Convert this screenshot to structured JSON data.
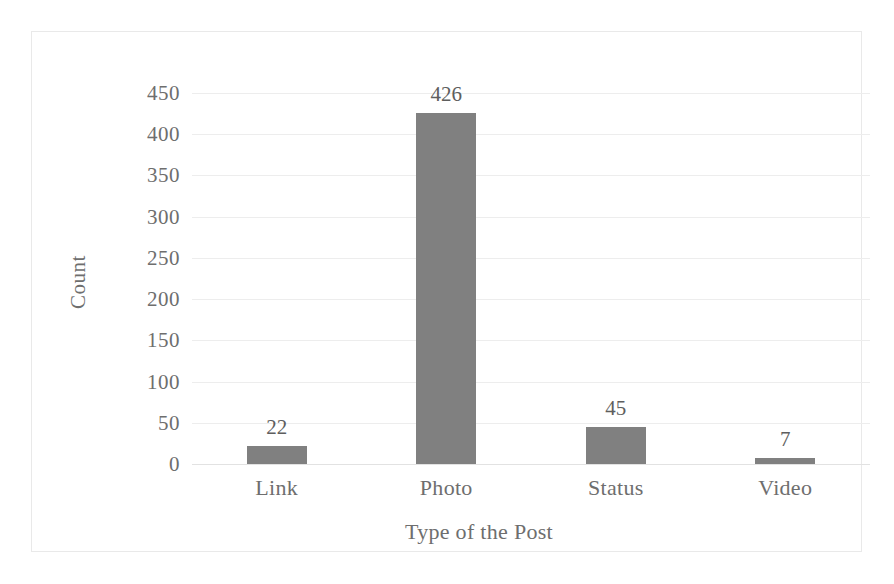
{
  "chart_data": {
    "type": "bar",
    "title": "",
    "subtitle": "",
    "categories": [
      "Link",
      "Photo",
      "Status",
      "Video"
    ],
    "values": [
      22,
      426,
      45,
      7
    ],
    "data_labels": [
      "22",
      "426",
      "45",
      "7"
    ],
    "xlabel": "Type of the Post",
    "ylabel": "Count",
    "ylim": [
      0,
      450
    ],
    "ytick_step": 50,
    "yticks": [
      450,
      400,
      350,
      300,
      250,
      200,
      150,
      100,
      50,
      0
    ],
    "ytick_labels": [
      "450",
      "400",
      "350",
      "300",
      "250",
      "200",
      "150",
      "100",
      "50",
      "0"
    ],
    "grid": true,
    "grid_axis": "y",
    "legend": false,
    "legend_position": "none",
    "series": [
      {
        "name": "Count",
        "values": [
          22,
          426,
          45,
          7
        ]
      }
    ],
    "colors": {
      "bar_fill": "#808080",
      "gridline": "#ededed",
      "frame": "#e9e9e9",
      "text": "#6e6e6e",
      "background": "#ffffff"
    }
  }
}
